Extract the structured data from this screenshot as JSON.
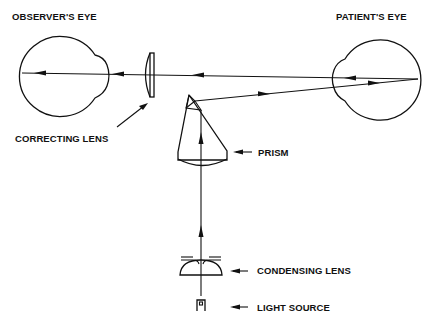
{
  "diagram": {
    "type": "optical schematic",
    "labels": {
      "observers_eye": "OBSERVER'S EYE",
      "patients_eye": "PATIENT'S EYE",
      "correcting_lens": "CORRECTING LENS",
      "prism": "PRISM",
      "condensing_lens": "CONDENSING LENS",
      "light_source": "LIGHT SOURCE"
    },
    "light_path": [
      "LIGHT SOURCE",
      "CONDENSING LENS",
      "PRISM",
      "PATIENT'S EYE",
      "CORRECTING LENS",
      "OBSERVER'S EYE"
    ],
    "colors": {
      "line": "#111111",
      "background": "#ffffff"
    }
  }
}
